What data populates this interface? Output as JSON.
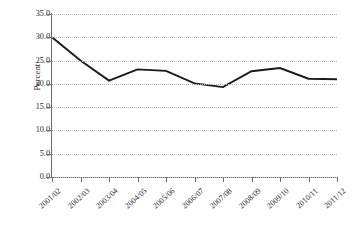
{
  "chart_data": {
    "type": "line",
    "title": "",
    "xlabel": "",
    "ylabel": "Percent",
    "categories": [
      "2001/02",
      "2002/03",
      "2003/04",
      "2004/05",
      "2005/06",
      "2006/07",
      "2007/08",
      "2008/09",
      "2009/10",
      "2010/11",
      "2011/12"
    ],
    "values": [
      30.0,
      25.0,
      20.7,
      23.1,
      22.8,
      20.1,
      19.3,
      22.7,
      23.4,
      21.1,
      21.0
    ],
    "series": [
      {
        "name": "Percent",
        "values": [
          30.0,
          25.0,
          20.7,
          23.1,
          22.8,
          20.1,
          19.3,
          22.7,
          23.4,
          21.1,
          21.0
        ]
      }
    ],
    "ylim": [
      0.0,
      35.0
    ],
    "ytick_labels": [
      "0.0",
      "5.0",
      "10.0",
      "15.0",
      "20.0",
      "25.0",
      "30.0",
      "35.0"
    ],
    "ytick_values": [
      0.0,
      5.0,
      10.0,
      15.0,
      20.0,
      25.0,
      30.0,
      35.0
    ],
    "grid": true,
    "grid_axis": "y",
    "grid_style": "dotted",
    "legend": false,
    "legend_position": "none",
    "line_color": "#1a1a1a",
    "line_width": 1.9,
    "markers": false,
    "background_color": "#ffffff",
    "axis_color": "#6e6e6e",
    "gridline_color": "#b9b9b9",
    "xtick_label_rotation": -42
  }
}
